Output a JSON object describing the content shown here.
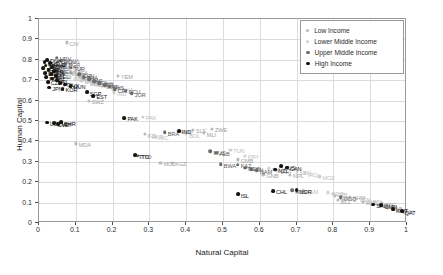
{
  "chart_data": {
    "type": "scatter",
    "title": "",
    "xlabel": "Natural Capital",
    "ylabel": "Human Capital",
    "xlim": [
      0,
      1
    ],
    "ylim": [
      0,
      1
    ],
    "xticks": [
      "0",
      "0.1",
      "0.2",
      "0.3",
      "0.4",
      "0.5",
      "0.6",
      "0.7",
      "0.8",
      "0.9",
      "1"
    ],
    "yticks": [
      "0",
      "0.1",
      "0.2",
      "0.3",
      "0.4",
      "0.5",
      "0.6",
      "0.7",
      "0.8",
      "0.9",
      "1"
    ],
    "grid": true,
    "legend_position": "top-right",
    "series": [
      {
        "name": "Low Income",
        "color": "#b9b9b9",
        "points": [
          {
            "label": "CIV",
            "x": 0.075,
            "y": 0.885
          },
          {
            "label": "ETH",
            "x": 0.052,
            "y": 0.79
          },
          {
            "label": "RWA",
            "x": 0.068,
            "y": 0.8
          },
          {
            "label": "UGA",
            "x": 0.061,
            "y": 0.772
          },
          {
            "label": "TZA",
            "x": 0.082,
            "y": 0.76
          },
          {
            "label": "BFA",
            "x": 0.097,
            "y": 0.742
          },
          {
            "label": "NER",
            "x": 0.089,
            "y": 0.735
          },
          {
            "label": "TCD",
            "x": 0.104,
            "y": 0.726
          },
          {
            "label": "BEN",
            "x": 0.112,
            "y": 0.718
          },
          {
            "label": "TGO",
            "x": 0.12,
            "y": 0.708
          },
          {
            "label": "GIN",
            "x": 0.131,
            "y": 0.7
          },
          {
            "label": "YEM",
            "x": 0.215,
            "y": 0.722
          },
          {
            "label": "NPL",
            "x": 0.169,
            "y": 0.69
          },
          {
            "label": "MDG",
            "x": 0.148,
            "y": 0.682
          },
          {
            "label": "GMB",
            "x": 0.54,
            "y": 0.312
          },
          {
            "label": "SLE",
            "x": 0.418,
            "y": 0.458
          },
          {
            "label": "MLI",
            "x": 0.448,
            "y": 0.44
          },
          {
            "label": "ZWE",
            "x": 0.47,
            "y": 0.462
          },
          {
            "label": "MDA",
            "x": 0.1,
            "y": 0.39
          },
          {
            "label": "SWZ",
            "x": 0.135,
            "y": 0.6
          },
          {
            "label": "FJI",
            "x": 0.288,
            "y": 0.436
          },
          {
            "label": "KGZ",
            "x": 0.362,
            "y": 0.295
          },
          {
            "label": "MOZ",
            "x": 0.33,
            "y": 0.296
          },
          {
            "label": "GNB",
            "x": 0.61,
            "y": 0.238
          },
          {
            "label": "NPL2",
            "x": 0.682,
            "y": 0.236
          },
          {
            "label": "TZA2",
            "x": 0.805,
            "y": 0.132
          },
          {
            "label": "KHM",
            "x": 0.845,
            "y": 0.128
          },
          {
            "label": "BLZ",
            "x": 0.812,
            "y": 0.112
          },
          {
            "label": "MNG",
            "x": 0.88,
            "y": 0.105
          },
          {
            "label": "PNG",
            "x": 0.932,
            "y": 0.098
          },
          {
            "label": "GAB",
            "x": 0.948,
            "y": 0.075
          },
          {
            "label": "GUY",
            "x": 0.978,
            "y": 0.062
          }
        ]
      },
      {
        "name": "Lower Middle Income",
        "color": "#cfcfcf",
        "points": [
          {
            "label": "KEN",
            "x": 0.044,
            "y": 0.76
          },
          {
            "label": "GHA",
            "x": 0.056,
            "y": 0.744
          },
          {
            "label": "SEN",
            "x": 0.07,
            "y": 0.736
          },
          {
            "label": "CMR",
            "x": 0.085,
            "y": 0.714
          },
          {
            "label": "ZMB",
            "x": 0.101,
            "y": 0.706
          },
          {
            "label": "LAO",
            "x": 0.116,
            "y": 0.698
          },
          {
            "label": "BGD",
            "x": 0.13,
            "y": 0.69
          },
          {
            "label": "PHL",
            "x": 0.144,
            "y": 0.684
          },
          {
            "label": "VNM",
            "x": 0.158,
            "y": 0.678
          },
          {
            "label": "MAR",
            "x": 0.172,
            "y": 0.672
          },
          {
            "label": "EGY",
            "x": 0.188,
            "y": 0.666
          },
          {
            "label": "IND",
            "x": 0.204,
            "y": 0.64
          },
          {
            "label": "LKA",
            "x": 0.22,
            "y": 0.66
          },
          {
            "label": "PAK",
            "x": 0.282,
            "y": 0.52
          },
          {
            "label": "UKR",
            "x": 0.298,
            "y": 0.428
          },
          {
            "label": "NIC",
            "x": 0.318,
            "y": 0.424
          },
          {
            "label": "HND",
            "x": 0.378,
            "y": 0.452
          },
          {
            "label": "BOL",
            "x": 0.4,
            "y": 0.436
          },
          {
            "label": "PRY",
            "x": 0.56,
            "y": 0.33
          },
          {
            "label": "TUN",
            "x": 0.52,
            "y": 0.36
          },
          {
            "label": "NGA",
            "x": 0.625,
            "y": 0.268
          },
          {
            "label": "DZA",
            "x": 0.648,
            "y": 0.255
          },
          {
            "label": "SDN",
            "x": 0.7,
            "y": 0.252
          },
          {
            "label": "IRQ",
            "x": 0.722,
            "y": 0.244
          },
          {
            "label": "YEM2",
            "x": 0.718,
            "y": 0.16
          },
          {
            "label": "MOZ2",
            "x": 0.762,
            "y": 0.228
          },
          {
            "label": "COG",
            "x": 0.786,
            "y": 0.15
          },
          {
            "label": "UZB",
            "x": 0.8,
            "y": 0.144
          },
          {
            "label": "VEN",
            "x": 0.862,
            "y": 0.12
          },
          {
            "label": "BOL2",
            "x": 0.898,
            "y": 0.11
          },
          {
            "label": "AGO",
            "x": 0.92,
            "y": 0.092
          }
        ]
      },
      {
        "name": "Upper Middle Income",
        "color": "#6b6b6b",
        "points": [
          {
            "label": "HRV",
            "x": 0.048,
            "y": 0.81
          },
          {
            "label": "ROU",
            "x": 0.06,
            "y": 0.795
          },
          {
            "label": "BGR",
            "x": 0.072,
            "y": 0.78
          },
          {
            "label": "SRB",
            "x": 0.038,
            "y": 0.77
          },
          {
            "label": "TUR",
            "x": 0.086,
            "y": 0.762
          },
          {
            "label": "MEX",
            "x": 0.05,
            "y": 0.748
          },
          {
            "label": "BRA",
            "x": 0.342,
            "y": 0.446
          },
          {
            "label": "CHN",
            "x": 0.11,
            "y": 0.73
          },
          {
            "label": "THA",
            "x": 0.122,
            "y": 0.716
          },
          {
            "label": "ZAF",
            "x": 0.136,
            "y": 0.704
          },
          {
            "label": "COL",
            "x": 0.15,
            "y": 0.694
          },
          {
            "label": "PER",
            "x": 0.164,
            "y": 0.686
          },
          {
            "label": "ARG",
            "x": 0.178,
            "y": 0.676
          },
          {
            "label": "MYS",
            "x": 0.192,
            "y": 0.668
          },
          {
            "label": "CRI",
            "x": 0.206,
            "y": 0.656
          },
          {
            "label": "ECU",
            "x": 0.236,
            "y": 0.648
          },
          {
            "label": "JOR",
            "x": 0.252,
            "y": 0.636
          },
          {
            "label": "BWA",
            "x": 0.494,
            "y": 0.288
          },
          {
            "label": "KAZ",
            "x": 0.54,
            "y": 0.286
          },
          {
            "label": "GEO",
            "x": 0.56,
            "y": 0.272
          },
          {
            "label": "IRN",
            "x": 0.576,
            "y": 0.265
          },
          {
            "label": "NAM",
            "x": 0.592,
            "y": 0.258
          },
          {
            "label": "TTO",
            "x": 0.268,
            "y": 0.33
          },
          {
            "label": "MUS",
            "x": 0.466,
            "y": 0.352
          },
          {
            "label": "ALB",
            "x": 0.482,
            "y": 0.345
          },
          {
            "label": "RUS",
            "x": 0.688,
            "y": 0.16
          },
          {
            "label": "GNQ",
            "x": 0.82,
            "y": 0.126
          }
        ]
      },
      {
        "name": "High Income",
        "color": "#141414",
        "points": [
          {
            "label": "DNK",
            "x": 0.022,
            "y": 0.8
          },
          {
            "label": "CHE",
            "x": 0.015,
            "y": 0.788
          },
          {
            "label": "SWE",
            "x": 0.03,
            "y": 0.784
          },
          {
            "label": "DEU",
            "x": 0.018,
            "y": 0.772
          },
          {
            "label": "AUT",
            "x": 0.034,
            "y": 0.766
          },
          {
            "label": "FRA",
            "x": 0.012,
            "y": 0.758
          },
          {
            "label": "GBR",
            "x": 0.026,
            "y": 0.75
          },
          {
            "label": "ITA",
            "x": 0.04,
            "y": 0.744
          },
          {
            "label": "ESP",
            "x": 0.016,
            "y": 0.736
          },
          {
            "label": "PRT",
            "x": 0.032,
            "y": 0.728
          },
          {
            "label": "BEL",
            "x": 0.046,
            "y": 0.722
          },
          {
            "label": "NLD",
            "x": 0.02,
            "y": 0.714
          },
          {
            "label": "FIN",
            "x": 0.036,
            "y": 0.708
          },
          {
            "label": "IRL",
            "x": 0.05,
            "y": 0.7
          },
          {
            "label": "CZE",
            "x": 0.024,
            "y": 0.692
          },
          {
            "label": "POL",
            "x": 0.058,
            "y": 0.686
          },
          {
            "label": "SVK",
            "x": 0.072,
            "y": 0.678
          },
          {
            "label": "HUN",
            "x": 0.086,
            "y": 0.672
          },
          {
            "label": "JPN",
            "x": 0.028,
            "y": 0.664
          },
          {
            "label": "KOR",
            "x": 0.064,
            "y": 0.658
          },
          {
            "label": "EST",
            "x": 0.148,
            "y": 0.624
          },
          {
            "label": "LUX",
            "x": 0.022,
            "y": 0.492
          },
          {
            "label": "BHR",
            "x": 0.06,
            "y": 0.494
          },
          {
            "label": "CYP",
            "x": 0.042,
            "y": 0.488
          },
          {
            "label": "MLT",
            "x": 0.052,
            "y": 0.486
          },
          {
            "label": "SGP",
            "x": 0.13,
            "y": 0.642
          },
          {
            "label": "PAK2",
            "x": 0.232,
            "y": 0.516
          },
          {
            "label": "IND2",
            "x": 0.38,
            "y": 0.452
          },
          {
            "label": "TTO2",
            "x": 0.262,
            "y": 0.332
          },
          {
            "label": "ISL",
            "x": 0.54,
            "y": 0.14
          },
          {
            "label": "NZL",
            "x": 0.642,
            "y": 0.262
          },
          {
            "label": "AUS",
            "x": 0.658,
            "y": 0.278
          },
          {
            "label": "CAN",
            "x": 0.674,
            "y": 0.272
          },
          {
            "label": "NOR",
            "x": 0.7,
            "y": 0.16
          },
          {
            "label": "CHL",
            "x": 0.636,
            "y": 0.158
          },
          {
            "label": "SAU",
            "x": 0.908,
            "y": 0.09
          },
          {
            "label": "OMN",
            "x": 0.93,
            "y": 0.086
          },
          {
            "label": "KWT",
            "x": 0.962,
            "y": 0.068
          },
          {
            "label": "QAT",
            "x": 0.986,
            "y": 0.058
          }
        ]
      }
    ]
  },
  "legend": {
    "items": [
      {
        "label": "Low Income"
      },
      {
        "label": "Lower Middle Income"
      },
      {
        "label": "Upper Middle Income"
      },
      {
        "label": "High Income"
      }
    ]
  },
  "annotations": {
    "visible_labels": [
      "CIV",
      "HRV",
      "YEM",
      "SWZ",
      "IND",
      "PAK",
      "SLE",
      "ZWE",
      "BRA",
      "MLI",
      "FJI",
      "UKR",
      "NIC",
      "LUX",
      "BHR",
      "MDA",
      "TTO",
      "MOZ",
      "KGZ",
      "GMB",
      "PRY",
      "ISL",
      "BWA",
      "KAZ",
      "NZL",
      "YEM",
      "MOZ",
      "BLZ",
      "MNG",
      "PNG",
      "GAB",
      "GUY",
      "SDN",
      "NPL",
      "TZA",
      "KHM",
      "BOL",
      "CYP",
      "MLT"
    ]
  }
}
